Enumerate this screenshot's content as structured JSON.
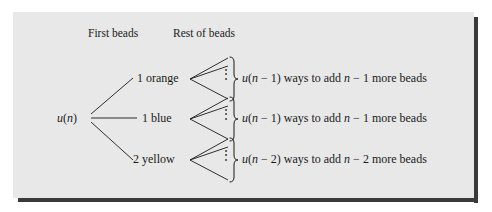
{
  "figure": {
    "kind": "recursion-tree-diagram",
    "background_color": "#ffffff",
    "panel_color": "#e8e8e8",
    "shadow_color": "#3a3a3a",
    "ink_color": "#1a1a1a"
  },
  "headers": {
    "first": "First beads",
    "rest": "Rest of beads"
  },
  "root": {
    "label": "u(n)",
    "label_parts": {
      "func": "u",
      "open": "(",
      "arg": "n",
      "close": ")"
    }
  },
  "branches": [
    {
      "id": "orange",
      "node_label": "1 orange",
      "count": "1",
      "color_word": "orange",
      "ellipsis": "⋮",
      "description": "u(n − 1) ways to add n − 1 more beads",
      "desc_parts": {
        "func": "u",
        "open": "(",
        "arg": "n",
        "minus": " − ",
        "offset": "1",
        "close": ")",
        "mid": " ways to add ",
        "arg2": "n",
        "minus2": " − ",
        "offset2": "1",
        "tail": " more beads"
      }
    },
    {
      "id": "blue",
      "node_label": "1 blue",
      "count": "1",
      "color_word": "blue",
      "ellipsis": "⋮",
      "description": "u(n − 1) ways to add n − 1 more beads",
      "desc_parts": {
        "func": "u",
        "open": "(",
        "arg": "n",
        "minus": " − ",
        "offset": "1",
        "close": ")",
        "mid": " ways to add ",
        "arg2": "n",
        "minus2": " − ",
        "offset2": "1",
        "tail": " more beads"
      }
    },
    {
      "id": "yellow",
      "node_label": "2 yellow",
      "count": "2",
      "color_word": "yellow",
      "ellipsis": "⋮",
      "description": "u(n − 2) ways to add n − 2 more beads",
      "desc_parts": {
        "func": "u",
        "open": "(",
        "arg": "n",
        "minus": " − ",
        "offset": "2",
        "close": ")",
        "mid": " ways to add ",
        "arg2": "n",
        "minus2": " − ",
        "offset2": "2",
        "tail": " more beads"
      }
    }
  ]
}
